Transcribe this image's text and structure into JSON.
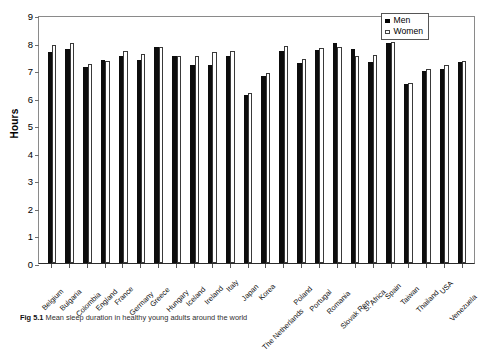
{
  "chart_data": {
    "type": "bar",
    "title": "",
    "xlabel": "",
    "ylabel": "Hours",
    "ylim": [
      0,
      9
    ],
    "yticks": [
      0,
      1,
      2,
      3,
      4,
      5,
      6,
      7,
      8,
      9
    ],
    "grid": false,
    "legend_position": "top-right",
    "categories": [
      "Belgium",
      "Bulgaria",
      "Colombia",
      "England",
      "France",
      "Germany",
      "Greece",
      "Hungary",
      "Iceland",
      "Ireland",
      "Italy",
      "Japan",
      "Korea",
      "The Netherlands",
      "Poland",
      "Portugal",
      "Romania",
      "Slovak Rep.",
      "S. Africa",
      "Spain",
      "Taiwan",
      "Thailand",
      "USA",
      "Venezuela"
    ],
    "series": [
      {
        "name": "Men",
        "color": "#0d0d0d",
        "values": [
          7.67,
          7.78,
          7.13,
          7.35,
          7.52,
          7.36,
          7.84,
          7.52,
          7.17,
          7.17,
          7.52,
          6.1,
          6.8,
          7.7,
          7.27,
          7.72,
          7.98,
          7.76,
          7.28,
          7.98,
          6.5,
          6.96,
          7.03,
          7.3
        ]
      },
      {
        "name": "Women",
        "color": "#ffffff",
        "values": [
          7.92,
          7.98,
          7.22,
          7.33,
          7.71,
          7.6,
          7.85,
          7.52,
          7.53,
          7.65,
          7.68,
          6.18,
          6.9,
          7.87,
          7.42,
          7.79,
          7.84,
          7.52,
          7.54,
          8.02,
          6.52,
          7.04,
          7.17,
          7.32
        ]
      }
    ]
  },
  "legend": {
    "items": [
      {
        "label": "Men",
        "swatch": "filled-square"
      },
      {
        "label": "Women",
        "swatch": "open-square"
      }
    ]
  },
  "caption": {
    "figure_number": "Fig 5.1",
    "text": "Mean sleep duration in healthy young adults around the world"
  }
}
